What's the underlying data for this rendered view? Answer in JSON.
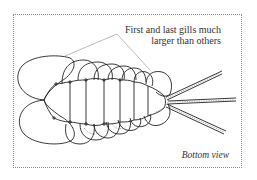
{
  "figure": {
    "annotation": {
      "line1": "First and last gills much",
      "line2": "larger than others"
    },
    "view_label": "Bottom view",
    "colors": {
      "ink": "#222222",
      "frame": "#8a8a8a",
      "background": "#ffffff"
    }
  }
}
